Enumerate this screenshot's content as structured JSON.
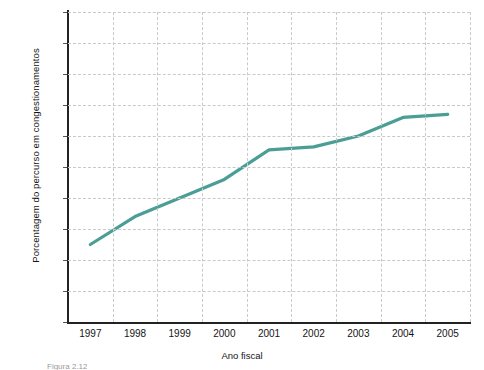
{
  "chart_data": {
    "type": "line",
    "title": "",
    "xlabel": "Ano fiscal",
    "ylabel": "Porcentagem do percurso em congestionamentos",
    "categories": [
      "1997",
      "1998",
      "1999",
      "2000",
      "2001",
      "2002",
      "2003",
      "2004",
      "2005"
    ],
    "x": [
      1997,
      1998,
      1999,
      2000,
      2001,
      2002,
      2003,
      2004,
      2005
    ],
    "values": [
      27.5,
      28.4,
      29.0,
      29.6,
      30.55,
      30.65,
      31.0,
      31.6,
      31.7
    ],
    "series": [
      {
        "name": "Porcentagem do percurso em congestionamentos",
        "values": [
          27.5,
          28.4,
          29.0,
          29.6,
          30.55,
          30.65,
          31.0,
          31.6,
          31.7
        ]
      }
    ],
    "ylim": [
      25,
      35
    ],
    "yticks": [
      25,
      26,
      27,
      28,
      29,
      30,
      31,
      32,
      33,
      34,
      35
    ],
    "ytick_labels": [
      "25",
      "26",
      "27",
      "28",
      "29",
      "30",
      "31",
      "32",
      "33",
      "34",
      "35"
    ],
    "xlim": [
      1996.5,
      2005.5
    ],
    "grid": "both-dashed",
    "legend": "none",
    "line_color": "#4a9e96",
    "line_width": 3.2,
    "grid_color": "#c9c9c9",
    "axis_color": "#222222",
    "background": "#ffffff"
  },
  "caption": {
    "text": "Figura 2.12"
  }
}
